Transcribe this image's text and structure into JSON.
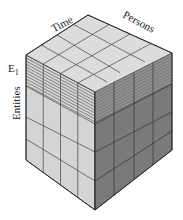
{
  "diagram": {
    "type": "3d-data-cube",
    "grid": {
      "time_divisions": 4,
      "persons_divisions": 4,
      "entities_divisions": 4
    },
    "labels": {
      "time": "Time",
      "persons": "Persons",
      "entities": "Entities",
      "slice": "E",
      "slice_subscript": "1"
    },
    "highlighted_slice": "E1 (top layer of entities, hatched)",
    "colors": {
      "top_face": "#d8d8d8",
      "left_face": "#cfcfcf",
      "right_face": "#7d7d7d",
      "edges": "#333333"
    }
  }
}
